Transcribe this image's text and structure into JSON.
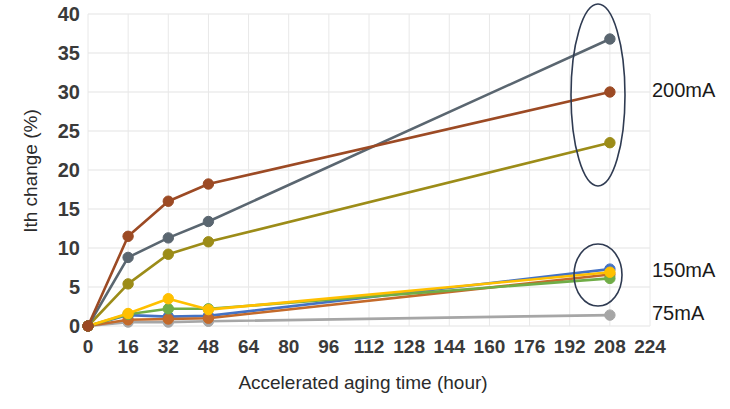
{
  "chart_data": {
    "type": "line",
    "title": "",
    "xlabel": "Accelerated aging time (hour)",
    "ylabel": "Ith change (%)",
    "xlim": [
      0,
      224
    ],
    "ylim": [
      0,
      40
    ],
    "xticks": [
      0,
      16,
      32,
      48,
      64,
      80,
      96,
      112,
      128,
      144,
      160,
      176,
      192,
      208,
      224
    ],
    "yticks": [
      0,
      5,
      10,
      15,
      20,
      25,
      30,
      35,
      40
    ],
    "grid": true,
    "legend_position": "right-annotations",
    "x": [
      0,
      16,
      32,
      48,
      208
    ],
    "series": [
      {
        "name": "200mA-a",
        "color": "#5a6670",
        "group": "200mA",
        "values": [
          0,
          8.8,
          11.3,
          13.4,
          36.8
        ]
      },
      {
        "name": "200mA-b",
        "color": "#9c4a24",
        "group": "200mA",
        "values": [
          0,
          11.5,
          16.0,
          18.2,
          30.0
        ]
      },
      {
        "name": "200mA-c",
        "color": "#9c8c18",
        "group": "200mA",
        "values": [
          0,
          5.4,
          9.2,
          10.8,
          23.5
        ]
      },
      {
        "name": "150mA-a",
        "color": "#4472c4",
        "group": "150mA",
        "values": [
          0,
          1.4,
          1.2,
          1.3,
          7.3
        ]
      },
      {
        "name": "150mA-b",
        "color": "#ffc000",
        "group": "150mA",
        "values": [
          0,
          1.6,
          3.5,
          2.1,
          6.9
        ]
      },
      {
        "name": "150mA-c",
        "color": "#70ad47",
        "group": "150mA",
        "values": [
          0,
          1.5,
          2.2,
          2.2,
          6.1
        ]
      },
      {
        "name": "150mA-d",
        "color": "#c46a2a",
        "group": "150mA",
        "values": [
          0,
          0.8,
          0.9,
          1.0,
          6.6
        ]
      },
      {
        "name": "75mA",
        "color": "#a6a6a6",
        "group": "75mA",
        "values": [
          0,
          0.5,
          0.5,
          0.6,
          1.4
        ]
      }
    ],
    "annotations": [
      {
        "label": "200mA",
        "x": 208,
        "y": 30.0,
        "circle": true
      },
      {
        "label": "150mA",
        "x": 208,
        "y": 6.9,
        "circle": true
      },
      {
        "label": "75mA",
        "x": 208,
        "y": 1.4,
        "circle": false
      }
    ]
  }
}
